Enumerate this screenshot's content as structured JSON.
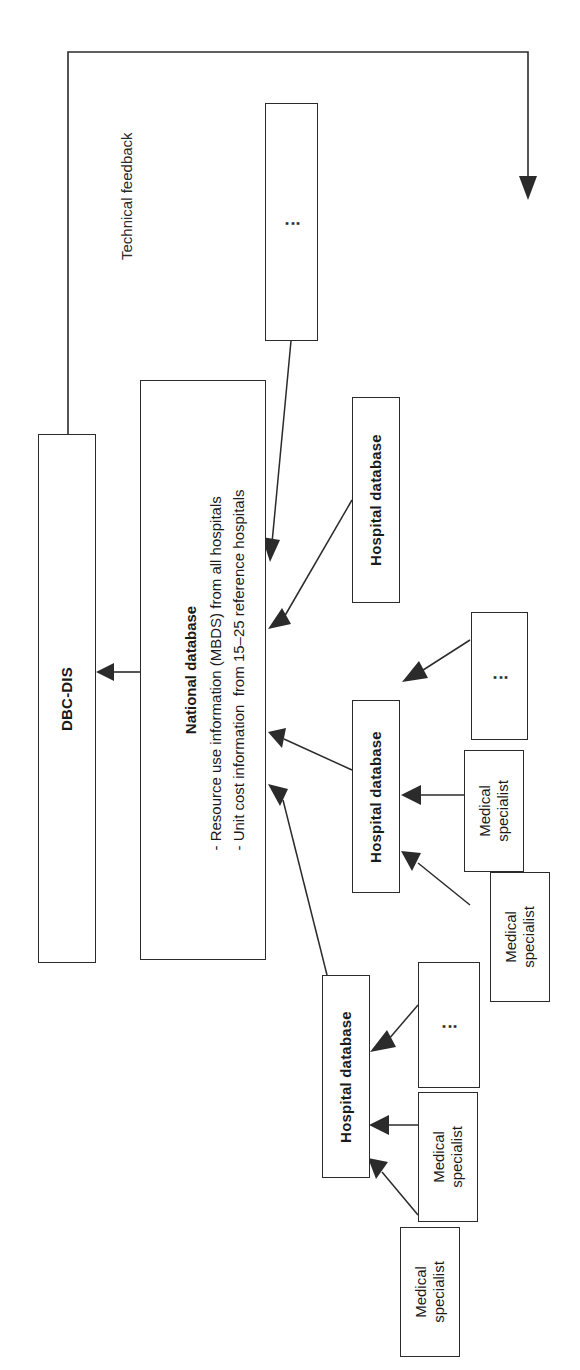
{
  "diagram": {
    "orientation": "rotated-90-ccw",
    "caption_feedback": "Technical feedback",
    "nodes": {
      "dbc_dis": {
        "label": "DBC-DIS"
      },
      "national_db": {
        "title": "National database",
        "line1": "- Resource use information (MBDS) from all hospitals",
        "line2": "- Unit cost information  from 15–25 reference hospitals"
      },
      "hospital_db_top": {
        "label": "Hospital database"
      },
      "hospital_db_mid": {
        "label": "Hospital database"
      },
      "hospital_db_bottom": {
        "label": "Hospital database"
      },
      "more_hospitals": {
        "label": "⋮"
      },
      "more_specialists_mid": {
        "label": "⋮"
      },
      "more_specialists_bottom": {
        "label": "⋮"
      },
      "specialist_mid_1": {
        "label": "Medical\nspecialist"
      },
      "specialist_mid_2": {
        "label": "Medical\nspecialist"
      },
      "specialist_bottom_1": {
        "label": "Medical\nspecialist"
      },
      "specialist_bottom_2": {
        "label": "Medical\nspecialist"
      }
    },
    "edges": [
      {
        "from": "national_db",
        "to": "dbc_dis",
        "label": ""
      },
      {
        "from": "dbc_dis",
        "to": "more_hospitals",
        "label": "Technical feedback"
      },
      {
        "from": "more_hospitals",
        "to": "national_db",
        "label": ""
      },
      {
        "from": "hospital_db_top",
        "to": "national_db",
        "label": ""
      },
      {
        "from": "hospital_db_mid",
        "to": "national_db",
        "label": ""
      },
      {
        "from": "hospital_db_bottom",
        "to": "national_db",
        "label": ""
      },
      {
        "from": "more_specialists_mid",
        "to": "hospital_db_mid",
        "label": ""
      },
      {
        "from": "specialist_mid_1",
        "to": "hospital_db_mid",
        "label": ""
      },
      {
        "from": "specialist_mid_2",
        "to": "hospital_db_mid",
        "label": ""
      },
      {
        "from": "more_specialists_bottom",
        "to": "hospital_db_bottom",
        "label": ""
      },
      {
        "from": "specialist_bottom_1",
        "to": "hospital_db_bottom",
        "label": ""
      },
      {
        "from": "specialist_bottom_2",
        "to": "hospital_db_bottom",
        "label": ""
      }
    ],
    "colors": {
      "stroke": "#2b2b2b",
      "background": "#ffffff",
      "text": "#1a1a1a"
    }
  }
}
